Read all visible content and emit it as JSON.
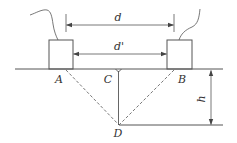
{
  "diagram": {
    "type": "geometry-measurement",
    "labels": {
      "d": "d",
      "d_prime": "d'",
      "A": "A",
      "B": "B",
      "C": "C",
      "D": "D",
      "h": "h"
    },
    "colors": {
      "line": "#555555",
      "text": "#333333",
      "background": "#ffffff"
    },
    "elements": {
      "ground_line": {
        "x1": 15,
        "y1": 69,
        "x2": 223,
        "y2": 69
      },
      "box_A": {
        "x": 49,
        "y": 40,
        "w": 24,
        "h": 29
      },
      "box_B": {
        "x": 167,
        "y": 40,
        "w": 25,
        "h": 29
      },
      "dim_d": {
        "x1": 66,
        "x2": 174,
        "y": 25
      },
      "dim_d_prime": {
        "x1": 74,
        "x2": 167,
        "y": 54
      },
      "point_A": {
        "x": 66,
        "y": 70
      },
      "point_B": {
        "x": 174,
        "y": 70
      },
      "point_C": {
        "x": 118,
        "y": 69
      },
      "point_D": {
        "x": 119,
        "y": 125
      },
      "dim_h": {
        "x": 211,
        "y1": 70,
        "y2": 125
      },
      "depth_line": {
        "x1": 119,
        "x2": 223,
        "y": 125
      }
    }
  }
}
